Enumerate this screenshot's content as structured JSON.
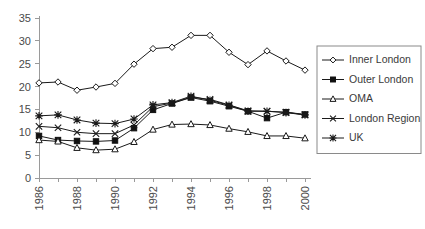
{
  "chart_data": {
    "type": "line",
    "title": "",
    "xlabel": "",
    "ylabel": "",
    "x": [
      1986,
      1987,
      1988,
      1989,
      1990,
      1991,
      1992,
      1993,
      1994,
      1995,
      1996,
      1997,
      1998,
      1999,
      2000
    ],
    "xtick_labels": [
      "1986",
      "1988",
      "1990",
      "1992",
      "1994",
      "1996",
      "1998",
      "2000"
    ],
    "xtick_values": [
      1986,
      1988,
      1990,
      1992,
      1994,
      1996,
      1998,
      2000
    ],
    "ytick_labels": [
      "0",
      "5",
      "10",
      "15",
      "20",
      "25",
      "30",
      "35"
    ],
    "ytick_values": [
      0,
      5,
      10,
      15,
      20,
      25,
      30,
      35
    ],
    "ylim": [
      0,
      35
    ],
    "xlim": [
      1986,
      2000
    ],
    "grid": false,
    "legend_position": "right",
    "series": [
      {
        "name": "Inner London",
        "marker": "open-diamond",
        "values": [
          20.8,
          21.0,
          19.2,
          19.9,
          20.7,
          24.9,
          28.3,
          28.6,
          31.2,
          31.2,
          27.5,
          24.8,
          27.8,
          25.6,
          23.6
        ]
      },
      {
        "name": "Outer London",
        "marker": "filled-square",
        "values": [
          9.2,
          8.3,
          8.1,
          8.0,
          8.2,
          10.9,
          14.9,
          16.3,
          17.6,
          16.8,
          15.7,
          14.6,
          13.1,
          14.4,
          13.9
        ]
      },
      {
        "name": "OMA",
        "marker": "open-triangle",
        "values": [
          8.3,
          8.0,
          6.6,
          6.1,
          6.3,
          7.9,
          10.6,
          11.7,
          11.8,
          11.6,
          10.8,
          10.1,
          9.2,
          9.2,
          8.7
        ]
      },
      {
        "name": "London Region",
        "marker": "x-cross",
        "values": [
          11.3,
          11.0,
          10.0,
          9.7,
          9.7,
          11.6,
          15.6,
          16.4,
          17.7,
          17.2,
          16.0,
          14.7,
          14.6,
          14.4,
          13.8
        ]
      },
      {
        "name": "UK",
        "marker": "asterisk",
        "values": [
          13.6,
          13.8,
          12.7,
          12.0,
          11.9,
          12.9,
          16.0,
          16.5,
          17.9,
          17.0,
          15.9,
          14.6,
          14.6,
          14.3,
          13.8
        ]
      }
    ]
  },
  "legend": {
    "items": [
      {
        "label": "Inner London"
      },
      {
        "label": "Outer London"
      },
      {
        "label": "OMA"
      },
      {
        "label": "London Region"
      },
      {
        "label": "UK"
      }
    ]
  }
}
